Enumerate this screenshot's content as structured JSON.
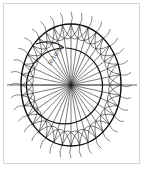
{
  "diagram": {
    "title": "",
    "label": "10/10/50",
    "colors": {
      "line": "#1a1a1a",
      "frame": "#d6d6d6",
      "background": "#ffffff"
    },
    "center": [
      71,
      85
    ],
    "outer_ellipse": {
      "rx": 50,
      "ry": 61
    },
    "inner_circle": {
      "cx": 75,
      "cy": 86,
      "r": 38
    },
    "radial_count": 36
  }
}
